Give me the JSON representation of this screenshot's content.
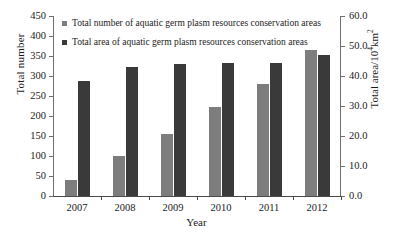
{
  "chart_data": {
    "type": "bar",
    "title": "",
    "subtitle": "",
    "xlabel": "Year",
    "ylabel": "Total number",
    "ylabel_right": "Total area/10⁴km²",
    "ylabel_right_base": "Total area/10",
    "ylabel_right_sup": "4",
    "ylabel_right_tail": "km",
    "ylabel_right_tail_sup": "2",
    "categories": [
      "2007",
      "2008",
      "2009",
      "2010",
      "2011",
      "2012"
    ],
    "grid": false,
    "legend_position": "top-left",
    "series": [
      {
        "name": "Total number of aquatic germ plasm resources conservation areas",
        "axis": "left",
        "color": "#7d7d7d",
        "values": [
          40,
          100,
          155,
          222,
          280,
          365
        ]
      },
      {
        "name": "Total area of aquatic germ plasm resources conservation areas",
        "axis": "right",
        "color": "#3a3a3a",
        "values": [
          38.5,
          43.0,
          44.0,
          44.3,
          44.3,
          47.0
        ]
      }
    ],
    "yaxis_left": {
      "label": "Total number",
      "min": 0,
      "max": 450,
      "step": 50,
      "ticks": [
        "0",
        "50",
        "100",
        "150",
        "200",
        "250",
        "300",
        "350",
        "400",
        "450"
      ],
      "tick_values": [
        0,
        50,
        100,
        150,
        200,
        250,
        300,
        350,
        400,
        450
      ]
    },
    "yaxis_right": {
      "label": "Total area/10⁴km²",
      "min": 0,
      "max": 60,
      "step": 10,
      "ticks": [
        "0.0",
        "10.0",
        "20.0",
        "30.0",
        "40.0",
        "50.0",
        "60.0"
      ],
      "tick_values": [
        0,
        10,
        20,
        30,
        40,
        50,
        60
      ]
    },
    "xaxis": {
      "label": "Year",
      "ticks": [
        "2007",
        "2008",
        "2009",
        "2010",
        "2011",
        "2012"
      ]
    }
  },
  "legend": {
    "items": [
      {
        "label": "Total number of aquatic germ plasm resources conservation areas",
        "color": "#7d7d7d",
        "swatch": "square-swatch-count"
      },
      {
        "label": "Total area of aquatic germ plasm resources conservation areas",
        "color": "#3a3a3a",
        "swatch": "square-swatch-area"
      }
    ]
  },
  "colors": {
    "series_count": "#7d7d7d",
    "series_area": "#3a3a3a",
    "axis": "#6f6f6f",
    "text": "#1a1a1a",
    "background": "#ffffff"
  }
}
